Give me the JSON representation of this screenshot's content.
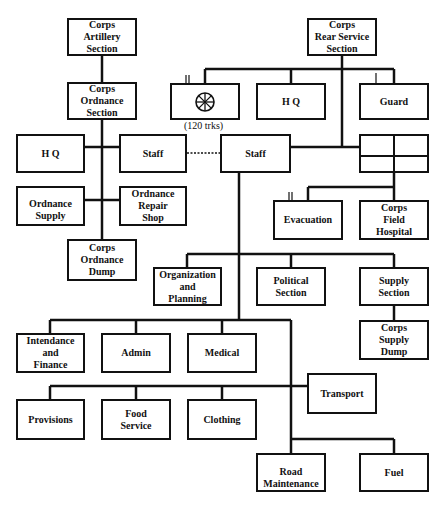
{
  "diagram": {
    "type": "organization-chart",
    "nodes": {
      "artillery": "Corps\nArtillery\nSection",
      "ordnance_section": "Corps\nOrdnance\nSection",
      "hq_left": "H Q",
      "staff_left": "Staff",
      "ordnance_supply": "Ordnance\nSupply",
      "ordnance_repair": "Ordnance\nRepair\nShop",
      "ordnance_dump": "Corps\nOrdnance\nDump",
      "rear_service": "Corps\nRear Service\nSection",
      "transport_unit": "",
      "transport_unit_caption": "(120 trks)",
      "hq_right": "H Q",
      "guard": "Guard",
      "staff_center": "Staff",
      "grid_unit": "",
      "evacuation": "Evacuation",
      "field_hospital": "Corps\nField\nHospital",
      "org_planning": "Organization\nand\nPlanning",
      "political": "Political\nSection",
      "supply_section": "Supply\nSection",
      "supply_dump": "Corps\nSupply\nDump",
      "intendance": "Intendance\nand\nFinance",
      "admin": "Admin",
      "medical": "Medical",
      "transport": "Transport",
      "provisions": "Provisions",
      "food_service": "Food\nService",
      "clothing": "Clothing",
      "road_maintenance": "Road\nMaintenance",
      "fuel": "Fuel"
    },
    "unit_size_markers": {
      "transport_unit": "II",
      "guard": "I",
      "evacuation": "II"
    },
    "icons": {
      "transport_unit": "wheel-icon"
    },
    "edges": [
      [
        "artillery",
        "ordnance_section"
      ],
      [
        "ordnance_section",
        "hq_left"
      ],
      [
        "ordnance_section",
        "staff_left"
      ],
      [
        "ordnance_section",
        "ordnance_supply"
      ],
      [
        "ordnance_section",
        "ordnance_repair"
      ],
      [
        "ordnance_section",
        "ordnance_dump"
      ],
      [
        "rear_service",
        "transport_unit"
      ],
      [
        "rear_service",
        "hq_right"
      ],
      [
        "rear_service",
        "guard"
      ],
      [
        "rear_service",
        "staff_center"
      ],
      [
        "rear_service",
        "grid_unit"
      ],
      [
        "grid_unit",
        "evacuation"
      ],
      [
        "grid_unit",
        "field_hospital"
      ],
      [
        "staff_center",
        "org_planning"
      ],
      [
        "staff_center",
        "political"
      ],
      [
        "staff_center",
        "supply_section"
      ],
      [
        "supply_section",
        "supply_dump"
      ],
      [
        "staff_center",
        "intendance"
      ],
      [
        "staff_center",
        "admin"
      ],
      [
        "staff_center",
        "medical"
      ],
      [
        "staff_center",
        "transport"
      ],
      [
        "staff_center",
        "provisions"
      ],
      [
        "staff_center",
        "food_service"
      ],
      [
        "staff_center",
        "clothing"
      ],
      [
        "staff_center",
        "road_maintenance"
      ],
      [
        "staff_center",
        "fuel"
      ]
    ],
    "dotted_edges": [
      [
        "staff_left",
        "staff_center"
      ]
    ]
  }
}
